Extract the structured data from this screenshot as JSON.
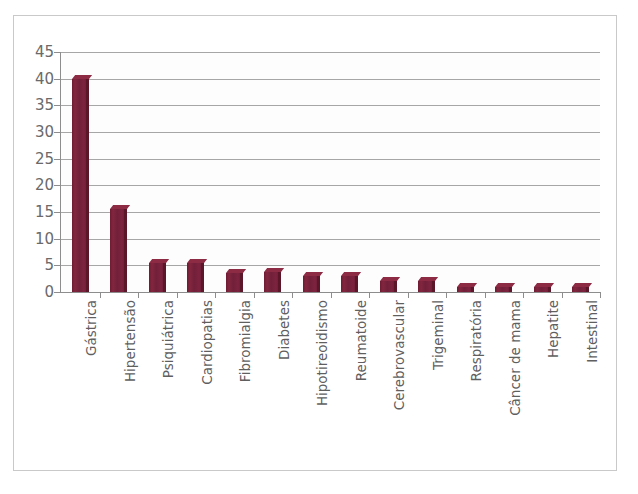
{
  "chart_data": {
    "type": "bar",
    "title": "",
    "xlabel": "",
    "ylabel": "",
    "ylim": [
      0,
      45
    ],
    "yticks": [
      0,
      5,
      10,
      15,
      20,
      25,
      30,
      35,
      40,
      45
    ],
    "grid": true,
    "legend": "none",
    "orientation": "vertical",
    "bar_color": "#76203a",
    "categories": [
      "Gástrica",
      "Hipertensão",
      "Psiquiátrica",
      "Cardiopatias",
      "Fibromialgia",
      "Diabetes",
      "Hipotireoidismo",
      "Reumatoide",
      "Cerebrovascular",
      "Trigeminal",
      "Respiratória",
      "Câncer de mama",
      "Hepatite",
      "Intestinal"
    ],
    "values": [
      40,
      15.5,
      5.5,
      5.5,
      3.5,
      3.8,
      3,
      3,
      2,
      2,
      1,
      1,
      1,
      1
    ]
  },
  "axis": {
    "y_tick_labels": [
      "0",
      "5",
      "10",
      "15",
      "20",
      "25",
      "30",
      "35",
      "40",
      "45"
    ]
  }
}
